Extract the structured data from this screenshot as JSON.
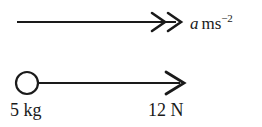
{
  "figure": {
    "kind": "free-body-force-diagram",
    "background_color": "#ffffff",
    "stroke_color": "#1a1a1a",
    "width": 262,
    "height": 127
  },
  "acceleration": {
    "symbol": "a",
    "unit_base": "ms",
    "unit_exponent": "−2",
    "full_text": "a ms⁻²",
    "arrow_type": "double-chevron",
    "arrow_start_x": 17,
    "arrow_end_x": 182,
    "arrow_y": 22
  },
  "body": {
    "mass_value": "5",
    "mass_unit": "kg",
    "mass_label": "5 kg",
    "shape": "open-circle",
    "center_x": 27,
    "center_y": 83,
    "radius": 11
  },
  "force": {
    "magnitude": "12",
    "unit": "N",
    "label": "12 N",
    "arrow_type": "single-chevron",
    "arrow_start_x": 38,
    "arrow_end_x": 185,
    "arrow_y": 83
  }
}
